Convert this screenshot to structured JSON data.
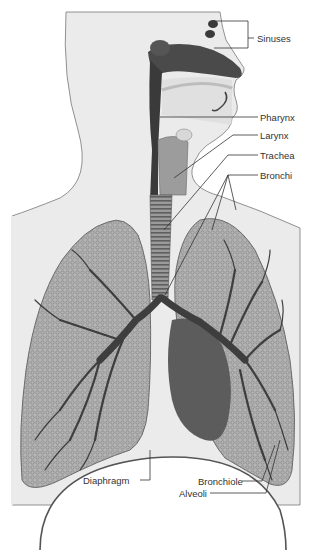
{
  "diagram": {
    "colors": {
      "background": "#ffffff",
      "body_fill": "#e8e8e8",
      "outline": "#555555",
      "lung_fill": "#a8a8a8",
      "lung_texture": "#8a8a8a",
      "airway": "#3c3c3c",
      "heart": "#5a5a5a",
      "leader_line": "#333333"
    },
    "labels": [
      {
        "id": "sinuses",
        "text": "Sinuses"
      },
      {
        "id": "pharynx",
        "text": "Pharynx"
      },
      {
        "id": "larynx",
        "text": "Larynx"
      },
      {
        "id": "trachea",
        "text": "Trachea"
      },
      {
        "id": "bronchi",
        "text": "Bronchi"
      },
      {
        "id": "diaphragm",
        "text": "Diaphragm"
      },
      {
        "id": "bronchiole",
        "text": "Bronchiole"
      },
      {
        "id": "alveoli",
        "text": "Alveoli"
      }
    ]
  }
}
